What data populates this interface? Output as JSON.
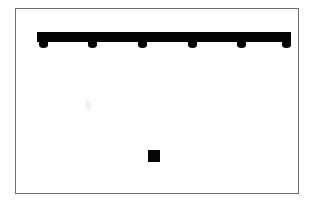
{
  "figure": {
    "title": "",
    "background_color": "#ffffff",
    "frame": {
      "border_color": "#6e6e6e",
      "border_width_px": 1,
      "x": 15,
      "y": 8,
      "width": 284,
      "height": 186,
      "fill": "#ffffff"
    },
    "ink_color": "#050505"
  },
  "bar": {
    "label": "horizontal-bar",
    "x": 36,
    "y": 31,
    "width": 254,
    "height": 10,
    "color": "#050505",
    "node_count": 6,
    "nodes": [
      {
        "label": "node-1",
        "cx": 42,
        "cy": 44
      },
      {
        "label": "node-2",
        "cx": 91,
        "cy": 44
      },
      {
        "label": "node-3",
        "cx": 141,
        "cy": 44
      },
      {
        "label": "node-4",
        "cx": 191,
        "cy": 44
      },
      {
        "label": "node-5",
        "cx": 240,
        "cy": 44
      },
      {
        "label": "node-6",
        "cx": 285,
        "cy": 44
      }
    ],
    "node_width": 9,
    "node_height": 6
  },
  "marker": {
    "label": "square-marker",
    "x": 147,
    "y": 149,
    "size": 12,
    "color": "#070707"
  },
  "artifact": {
    "label": "scan-smudge",
    "x": 84,
    "y": 99,
    "color": "#f2f2f2"
  }
}
